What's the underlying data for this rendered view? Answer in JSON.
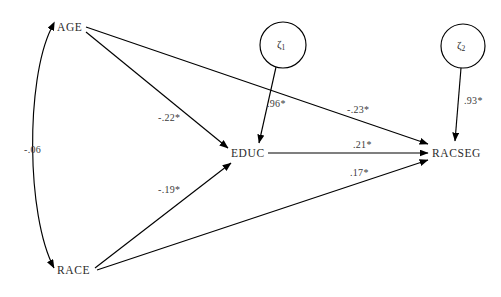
{
  "diagram": {
    "type": "path-diagram",
    "title": "",
    "background_color": "#ffffff",
    "line_color": "#000000",
    "text_color": "#2b2b2b",
    "nodes": [
      {
        "id": "age",
        "label": "AGE",
        "shape": "none",
        "x": 69,
        "y": 28
      },
      {
        "id": "race",
        "label": "RACE",
        "shape": "none",
        "x": 75,
        "y": 271
      },
      {
        "id": "educ",
        "label": "EDUC",
        "shape": "none",
        "x": 247,
        "y": 154
      },
      {
        "id": "racseg",
        "label": "RACSEG",
        "shape": "none",
        "x": 460,
        "y": 154
      },
      {
        "id": "zeta1",
        "label": "ζ",
        "subscript": "1",
        "shape": "circle",
        "x": 283,
        "y": 45,
        "r": 23
      },
      {
        "id": "zeta2",
        "label": "ζ",
        "subscript": "2",
        "shape": "circle",
        "x": 463,
        "y": 46,
        "r": 22
      }
    ],
    "paths": [
      {
        "id": "age-educ",
        "from": "age",
        "to": "educ",
        "coefficient": "-.22*",
        "significant": true,
        "style": "straight",
        "arrow": "single"
      },
      {
        "id": "age-racseg",
        "from": "age",
        "to": "racseg",
        "coefficient": "-.23*",
        "significant": true,
        "style": "straight",
        "arrow": "single"
      },
      {
        "id": "race-educ",
        "from": "race",
        "to": "educ",
        "coefficient": "-.19*",
        "significant": true,
        "style": "straight",
        "arrow": "single"
      },
      {
        "id": "race-racseg",
        "from": "race",
        "to": "racseg",
        "coefficient": ".17*",
        "significant": true,
        "style": "straight",
        "arrow": "single"
      },
      {
        "id": "educ-racseg",
        "from": "educ",
        "to": "racseg",
        "coefficient": ".21*",
        "significant": true,
        "style": "straight",
        "arrow": "single"
      },
      {
        "id": "zeta1-educ",
        "from": "zeta1",
        "to": "educ",
        "coefficient": ".96*",
        "significant": true,
        "style": "straight",
        "arrow": "single"
      },
      {
        "id": "zeta2-racseg",
        "from": "zeta2",
        "to": "racseg",
        "coefficient": ".93*",
        "significant": true,
        "style": "straight",
        "arrow": "single"
      },
      {
        "id": "age-race-cov",
        "from": "age",
        "to": "race",
        "coefficient": "-.06",
        "significant": false,
        "style": "curved",
        "arrow": "double"
      }
    ],
    "coefficient_labels": {
      "age_educ": {
        "text": "-.22*",
        "x": 158,
        "y": 113
      },
      "age_racseg": {
        "text": "-.23*",
        "x": 347,
        "y": 105
      },
      "race_educ": {
        "text": "-.19*",
        "x": 158,
        "y": 185
      },
      "race_racseg": {
        "text": ".17*",
        "x": 350,
        "y": 168
      },
      "educ_racseg": {
        "text": ".21*",
        "x": 353,
        "y": 140
      },
      "zeta1_educ": {
        "text": ".96*",
        "x": 267,
        "y": 99
      },
      "zeta2_racseg": {
        "text": ".93*",
        "x": 464,
        "y": 96
      },
      "age_race_cov": {
        "text": "-.06",
        "x": 24,
        "y": 145
      }
    }
  }
}
